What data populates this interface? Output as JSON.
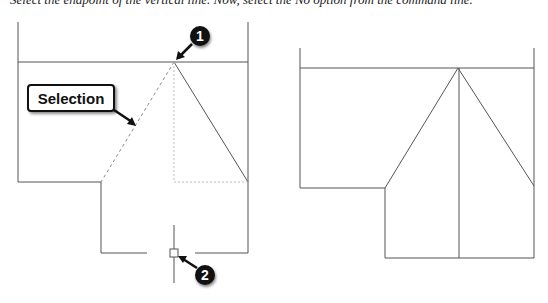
{
  "caption": "Select the endpoint of the vertical line. Now, select the No option from the command line.",
  "callouts": {
    "selection_label": "Selection",
    "marker_1": "1",
    "marker_2": "2"
  },
  "colors": {
    "line": "#555555",
    "dotted_line": "#888888",
    "callout_fill": "#111111"
  }
}
